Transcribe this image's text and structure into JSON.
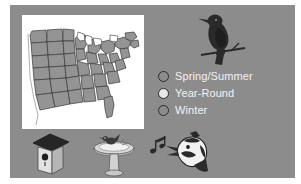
{
  "slide": {
    "background_color": "#8c8c8c",
    "outer_color": "#ffffff"
  },
  "map": {
    "name": "eastern-united-states-range-map",
    "panel_color": "#ffffff",
    "state_fill": "#949494",
    "state_outline": "#3a3a3a",
    "water_fill": "#ffffff",
    "description": "Shaded range map of the central and eastern United States"
  },
  "perched_bird": {
    "icon": "perched-bird-silhouette",
    "color": "#2a2a2a"
  },
  "legend": {
    "items": [
      {
        "label": "Spring/Summer",
        "swatch_color": "#8c8c8c",
        "swatch_outline": "#2b2b2b"
      },
      {
        "label": "Year-Round",
        "swatch_color": "#e8e8e8",
        "swatch_outline": "#2b2b2b"
      },
      {
        "label": "Winter",
        "swatch_color": "#8c8c8c",
        "swatch_outline": "#2b2b2b"
      }
    ],
    "text_color": "#f2f2f2"
  },
  "bottom_icons": [
    {
      "icon": "birdhouse-icon",
      "label": "Birdhouse"
    },
    {
      "icon": "birdbath-icon",
      "label": "Birdbath"
    },
    {
      "icon": "singing-bird-icon",
      "label": "Singing bird with music notes"
    }
  ]
}
